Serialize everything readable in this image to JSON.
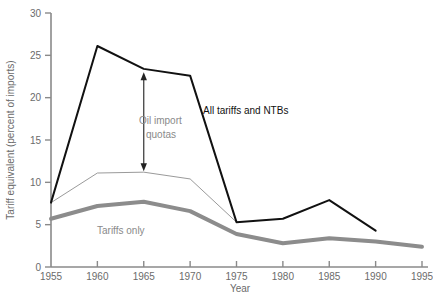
{
  "chart_data": {
    "type": "line",
    "title": "",
    "xlabel": "Year",
    "ylabel": "Tariff equivalent (percent of imports)",
    "x": [
      1955,
      1960,
      1965,
      1970,
      1975,
      1980,
      1985,
      1990,
      1995
    ],
    "xlim": [
      1955,
      1995
    ],
    "ylim": [
      0,
      30
    ],
    "xticks": [
      1955,
      1960,
      1965,
      1970,
      1975,
      1980,
      1985,
      1990,
      1995
    ],
    "xtick_labels": [
      "1955",
      "1960",
      "1965",
      "1970",
      "1975",
      "1980",
      "1985",
      "1990",
      "1995"
    ],
    "yticks": [
      0,
      5,
      10,
      15,
      20,
      25,
      30
    ],
    "ytick_labels": [
      "0",
      "5",
      "10",
      "15",
      "20",
      "25",
      "30"
    ],
    "grid": false,
    "legend_position": "inline-annotations",
    "series": [
      {
        "name": "All tariffs and NTBs",
        "color": "#111111",
        "width": 2.0,
        "x": [
          1955,
          1960,
          1965,
          1970,
          1975,
          1980,
          1985,
          1990
        ],
        "values": [
          7.6,
          26.1,
          23.4,
          22.6,
          5.3,
          5.7,
          7.9,
          4.3
        ]
      },
      {
        "name": "Tariffs and non-oil NTBs",
        "color": "#9a9a9a",
        "width": 1.0,
        "x": [
          1955,
          1960,
          1965,
          1970,
          1975
        ],
        "values": [
          7.6,
          11.1,
          11.2,
          10.4,
          5.3
        ]
      },
      {
        "name": "Tariffs only",
        "color": "#8c8c8c",
        "width": 4.0,
        "x": [
          1955,
          1960,
          1965,
          1970,
          1975,
          1980,
          1985,
          1990,
          1995
        ],
        "values": [
          5.7,
          7.2,
          7.7,
          6.6,
          3.9,
          2.8,
          3.4,
          3.0,
          2.4
        ]
      }
    ],
    "annotations": [
      {
        "name": "oil-import-quotas",
        "text_line1": "Oil import",
        "text_line2": "quotas",
        "color": "#8a8a8a",
        "arrow": {
          "x": 1965,
          "y_top": 23.0,
          "y_bottom": 11.3,
          "double_headed": true
        }
      },
      {
        "name": "all-tariffs-and-ntbs",
        "text_line1": "All tariffs and NTBs",
        "color": "#111111"
      },
      {
        "name": "tariffs-only",
        "text_line1": "Tariffs only",
        "color": "#8a8a8a"
      }
    ],
    "axis_color": "#8a8a8a"
  }
}
